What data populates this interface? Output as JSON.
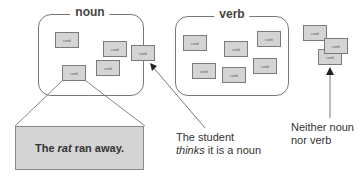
{
  "sets": [
    {
      "id": "noun",
      "label": "noun"
    },
    {
      "id": "verb",
      "label": "verb"
    }
  ],
  "card_label": "rank",
  "sentence": {
    "pre": "The ",
    "emph": "rat",
    "post": " ran away."
  },
  "annotations": {
    "student_line1": "The student",
    "student_line2_emph": "thinks",
    "student_line2_rest": " it is a noun",
    "neither_line1": "Neither noun",
    "neither_line2": "nor verb"
  },
  "colors": {
    "card_fill": "#d4d4d4",
    "card_border": "#7a7a7a",
    "line": "#555555"
  }
}
